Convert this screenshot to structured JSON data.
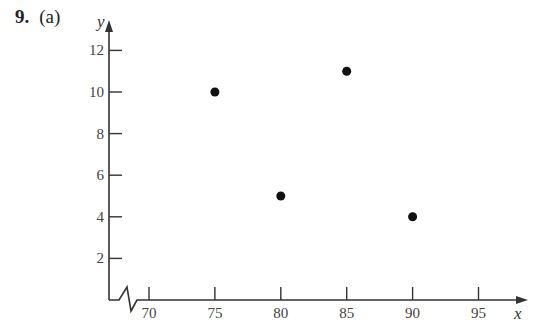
{
  "problem": {
    "number": "9.",
    "part": "(a)"
  },
  "chart_data": {
    "type": "scatter",
    "title": "",
    "xlabel": "x",
    "ylabel": "y",
    "x_ticks": [
      70,
      75,
      80,
      85,
      90,
      95
    ],
    "y_ticks": [
      2,
      4,
      6,
      8,
      10,
      12
    ],
    "xlim": [
      67,
      97
    ],
    "ylim": [
      0,
      13
    ],
    "x_axis_break": true,
    "grid": false,
    "legend": null,
    "points": [
      {
        "x": 75,
        "y": 10
      },
      {
        "x": 80,
        "y": 5
      },
      {
        "x": 85,
        "y": 11
      },
      {
        "x": 90,
        "y": 4
      }
    ]
  },
  "colors": {
    "axis": "#333333",
    "point": "#111111",
    "text": "#444444"
  }
}
